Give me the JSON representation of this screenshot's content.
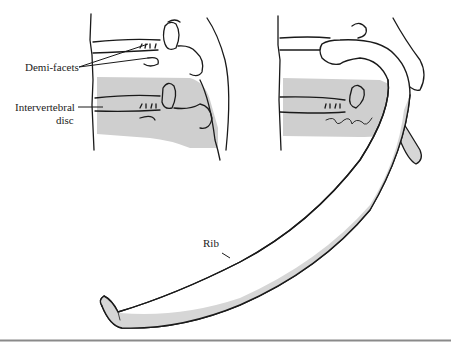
{
  "figure": {
    "labels": {
      "demi_facets": "Demi-facets",
      "intervertebral_line1": "Intervertebral",
      "intervertebral_line2": "disc",
      "rib": "Rib"
    },
    "signature": "JGM",
    "colors": {
      "line": "#1a1a1a",
      "shade": "#cfcfcf",
      "rib_shade": "#d6d6d6",
      "rule": "#8a8a8a",
      "background": "#ffffff"
    }
  }
}
